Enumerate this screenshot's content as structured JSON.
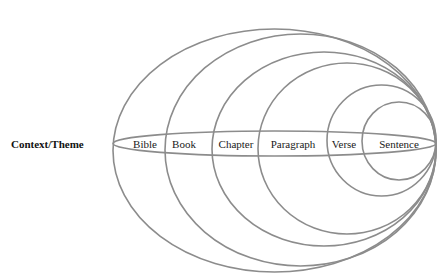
{
  "diagram": {
    "title_cutoff": "",
    "side_label": "Context/Theme",
    "stroke_color": "#8c8c8c",
    "levels": [
      {
        "label": "Bible",
        "ellipse": {
          "cx": 274.5,
          "cy": 150.5,
          "rx": 161.5,
          "ry": 121.5
        },
        "label_x": 145
      },
      {
        "label": "Book",
        "ellipse": {
          "cx": 300.5,
          "cy": 150,
          "rx": 135.5,
          "ry": 116
        },
        "label_x": 184
      },
      {
        "label": "Chapter",
        "ellipse": {
          "cx": 324,
          "cy": 149,
          "rx": 112,
          "ry": 97
        },
        "label_x": 236
      },
      {
        "label": "Paragraph",
        "ellipse": {
          "cx": 347,
          "cy": 148.5,
          "rx": 89,
          "ry": 85.5
        },
        "label_x": 293
      },
      {
        "label": "Verse",
        "ellipse": {
          "cx": 381.5,
          "cy": 140.5,
          "rx": 54.5,
          "ry": 55.5
        },
        "label_x": 344
      },
      {
        "label": "Sentence",
        "ellipse": {
          "cx": 399,
          "cy": 141,
          "rx": 37,
          "ry": 39
        },
        "label_x": 399
      }
    ],
    "band": {
      "cx": 274.5,
      "cy": 143.5,
      "rx": 161.5,
      "ry": 12.5
    }
  }
}
